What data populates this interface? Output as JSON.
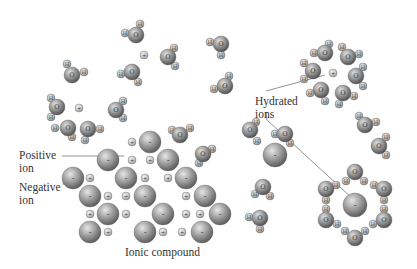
{
  "figure": {
    "caption": "Ionic compound",
    "labels": {
      "positive_ion": [
        "Positive",
        "ion"
      ],
      "negative_ion": [
        "Negative",
        "ion"
      ],
      "hydrated_ions": [
        "Hydrated",
        "ions"
      ]
    },
    "atom_symbols": {
      "oxygen": "O",
      "hydrogen": "H",
      "positive": "+",
      "negative": "-"
    },
    "colors": {
      "background": "#ffffff",
      "sphere_light": "#d9d9d9",
      "sphere_mid": "#9a9a9a",
      "sphere_dark": "#555555",
      "leader_line": "#777777",
      "text": "#333333"
    }
  },
  "crystal": {
    "negative_ions": [
      [
        150,
        142
      ],
      [
        108,
        160
      ],
      [
        168,
        160
      ],
      [
        73,
        178
      ],
      [
        126,
        178
      ],
      [
        186,
        178
      ],
      [
        90,
        196
      ],
      [
        145,
        196
      ],
      [
        205,
        196
      ],
      [
        108,
        214
      ],
      [
        163,
        214
      ],
      [
        220,
        214
      ],
      [
        90,
        232
      ],
      [
        145,
        232
      ],
      [
        202,
        232
      ]
    ],
    "positive_ions": [
      [
        132,
        142
      ],
      [
        132,
        160
      ],
      [
        150,
        160
      ],
      [
        90,
        178
      ],
      [
        145,
        178
      ],
      [
        168,
        178
      ],
      [
        108,
        196
      ],
      [
        126,
        196
      ],
      [
        186,
        196
      ],
      [
        90,
        214
      ],
      [
        126,
        214
      ],
      [
        186,
        214
      ],
      [
        200,
        214
      ],
      [
        108,
        232
      ],
      [
        163,
        232
      ],
      [
        182,
        232
      ]
    ]
  },
  "free_ions": {
    "positive": [
      [
        144,
        55
      ],
      [
        79,
        108
      ],
      [
        333,
        73
      ]
    ],
    "negative": [
      [
        275,
        155
      ],
      [
        355,
        205
      ]
    ]
  },
  "water_molecules": [
    {
      "o": [
        136,
        35
      ],
      "h": [
        [
          140,
          24
        ],
        [
          125,
          33
        ]
      ]
    },
    {
      "o": [
        168,
        57
      ],
      "h": [
        [
          174,
          48
        ],
        [
          175,
          66
        ]
      ]
    },
    {
      "o": [
        72,
        75
      ],
      "h": [
        [
          67,
          64
        ],
        [
          84,
          72
        ]
      ]
    },
    {
      "o": [
        132,
        72
      ],
      "h": [
        [
          121,
          74
        ],
        [
          138,
          82
        ]
      ]
    },
    {
      "o": [
        221,
        44
      ],
      "h": [
        [
          210,
          42
        ],
        [
          221,
          55
        ]
      ]
    },
    {
      "o": [
        225,
        86
      ],
      "h": [
        [
          229,
          76
        ],
        [
          214,
          89
        ]
      ]
    },
    {
      "o": [
        57,
        107
      ],
      "h": [
        [
          51,
          98
        ],
        [
          51,
          117
        ]
      ]
    },
    {
      "o": [
        116,
        110
      ],
      "h": [
        [
          123,
          101
        ],
        [
          123,
          118
        ]
      ]
    },
    {
      "o": [
        68,
        128
      ],
      "h": [
        [
          55,
          128
        ],
        [
          72,
          137
        ]
      ]
    },
    {
      "o": [
        88,
        129
      ],
      "h": [
        [
          100,
          129
        ],
        [
          85,
          140
        ]
      ]
    },
    {
      "o": [
        325,
        53
      ],
      "h": [
        [
          329,
          44
        ],
        [
          314,
          53
        ]
      ]
    },
    {
      "o": [
        348,
        57
      ],
      "h": [
        [
          342,
          47
        ],
        [
          359,
          54
        ]
      ]
    },
    {
      "o": [
        313,
        71
      ],
      "h": [
        [
          304,
          63
        ],
        [
          304,
          79
        ]
      ]
    },
    {
      "o": [
        356,
        76
      ],
      "h": [
        [
          363,
          67
        ],
        [
          363,
          86
        ]
      ]
    },
    {
      "o": [
        321,
        90
      ],
      "h": [
        [
          310,
          93
        ],
        [
          325,
          101
        ]
      ]
    },
    {
      "o": [
        343,
        93
      ],
      "h": [
        [
          354,
          96
        ],
        [
          339,
          104
        ]
      ]
    },
    {
      "o": [
        365,
        125
      ],
      "h": [
        [
          359,
          116
        ],
        [
          376,
          122
        ]
      ]
    },
    {
      "o": [
        379,
        146
      ],
      "h": [
        [
          386,
          137
        ],
        [
          386,
          155
        ]
      ]
    },
    {
      "o": [
        180,
        135
      ],
      "h": [
        [
          172,
          130
        ],
        [
          190,
          128
        ]
      ]
    },
    {
      "o": [
        203,
        154
      ],
      "h": [
        [
          212,
          149
        ],
        [
          199,
          163
        ]
      ]
    },
    {
      "o": [
        250,
        130
      ],
      "h": [
        [
          256,
          122
        ],
        [
          257,
          141
        ]
      ]
    },
    {
      "o": [
        285,
        134
      ],
      "h": [
        [
          275,
          134
        ],
        [
          290,
          143
        ]
      ]
    },
    {
      "o": [
        355,
        172
      ],
      "h": [
        [
          346,
          181
        ],
        [
          364,
          181
        ]
      ]
    },
    {
      "o": [
        326,
        189
      ],
      "h": [
        [
          336,
          185
        ],
        [
          326,
          200
        ]
      ]
    },
    {
      "o": [
        384,
        189
      ],
      "h": [
        [
          374,
          185
        ],
        [
          384,
          200
        ]
      ]
    },
    {
      "o": [
        326,
        220
      ],
      "h": [
        [
          326,
          209
        ],
        [
          337,
          224
        ]
      ]
    },
    {
      "o": [
        384,
        220
      ],
      "h": [
        [
          384,
          209
        ],
        [
          373,
          224
        ]
      ]
    },
    {
      "o": [
        355,
        238
      ],
      "h": [
        [
          345,
          231
        ],
        [
          365,
          231
        ]
      ]
    },
    {
      "o": [
        263,
        187
      ],
      "h": [
        [
          255,
          194
        ],
        [
          270,
          196
        ]
      ]
    },
    {
      "o": [
        260,
        218
      ],
      "h": [
        [
          249,
          217
        ],
        [
          260,
          229
        ]
      ]
    }
  ]
}
